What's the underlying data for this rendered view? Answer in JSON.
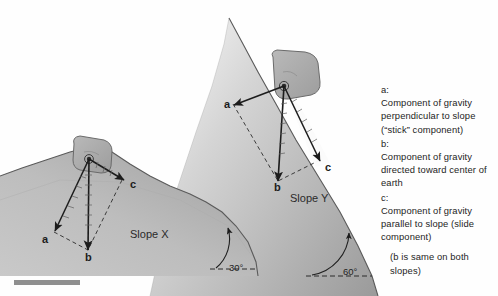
{
  "figure": {
    "title_absent": true,
    "background_color": "#fefefe",
    "ink_color": "#1c1c1c",
    "terrain_fill": "#b5b5b5"
  },
  "legend": {
    "entries": [
      {
        "key": "a:",
        "description": "Component of gravity perpendicular to slope (“stick” component)"
      },
      {
        "key": "b:",
        "description": "Component of gravity directed toward center of earth"
      },
      {
        "key": "c:",
        "description": "Component of gravity parallel to slope (slide component)"
      }
    ],
    "note": "(b is same on both slopes)"
  },
  "slopes": [
    {
      "name": "Slope X",
      "angle_label": "30°",
      "angle_degrees": 30,
      "vectors": [
        {
          "label": "a",
          "type": "solid-arrow",
          "meaning": "perpendicular-to-slope"
        },
        {
          "label": "b",
          "type": "solid-arrow",
          "meaning": "toward-center-of-earth"
        },
        {
          "label": "c",
          "type": "solid-arrow",
          "meaning": "parallel-to-slope"
        }
      ]
    },
    {
      "name": "Slope Y",
      "angle_label": "60°",
      "angle_degrees": 60,
      "vectors": [
        {
          "label": "a",
          "type": "solid-arrow",
          "meaning": "perpendicular-to-slope"
        },
        {
          "label": "b",
          "type": "solid-arrow",
          "meaning": "toward-center-of-earth"
        },
        {
          "label": "c",
          "type": "solid-arrow",
          "meaning": "parallel-to-slope"
        }
      ]
    }
  ],
  "labels": {
    "slope_x_name": "Slope X",
    "slope_y_name": "Slope Y",
    "slope_x_angle": "30°",
    "slope_y_angle": "60°",
    "x_a": "a",
    "x_b": "b",
    "x_c": "c",
    "y_a": "a",
    "y_b": "b",
    "y_c": "c"
  }
}
